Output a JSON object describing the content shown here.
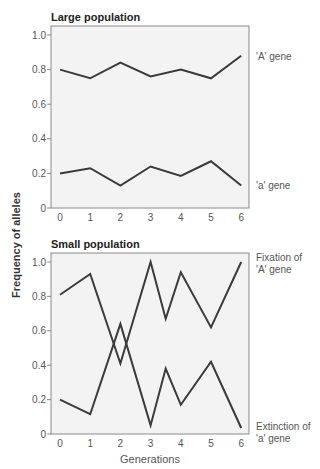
{
  "chart_data": [
    {
      "type": "line",
      "title": "Large population",
      "xlabel": "",
      "ylabel": "Frequency of alleles",
      "ylim": [
        0,
        1.0
      ],
      "yticks": [
        "0",
        "0.2",
        "0.4",
        "0.6",
        "0.8",
        "1.0"
      ],
      "xticks": [
        "0",
        "1",
        "2",
        "3",
        "4",
        "5",
        "6"
      ],
      "x": [
        0,
        1,
        2,
        3,
        4,
        5,
        6
      ],
      "series": [
        {
          "name": "'A' gene",
          "values": [
            0.8,
            0.75,
            0.84,
            0.76,
            0.8,
            0.75,
            0.88
          ]
        },
        {
          "name": "'a' gene",
          "values": [
            0.2,
            0.23,
            0.13,
            0.24,
            0.185,
            0.27,
            0.13
          ]
        }
      ],
      "annotations": [
        "'A' gene",
        "'a' gene"
      ],
      "grid": false
    },
    {
      "type": "line",
      "title": "Small population",
      "xlabel": "Generations",
      "ylabel": "Frequency of alleles",
      "ylim": [
        0,
        1.0
      ],
      "yticks": [
        "0",
        "0.2",
        "0.4",
        "0.6",
        "0.8",
        "1.0"
      ],
      "xticks": [
        "0",
        "1",
        "2",
        "3",
        "4",
        "5",
        "6"
      ],
      "x": [
        0,
        1,
        2,
        3,
        3.5,
        4,
        5,
        6
      ],
      "series": [
        {
          "name": "'A' gene",
          "values": [
            0.81,
            0.93,
            0.41,
            1.0,
            0.67,
            0.94,
            0.62,
            1.0
          ]
        },
        {
          "name": "'a' gene",
          "values": [
            0.2,
            0.115,
            0.64,
            0.05,
            0.38,
            0.17,
            0.42,
            0.035
          ]
        }
      ],
      "annotations": [
        "Fixation of 'A' gene",
        "Extinction of 'a' gene"
      ],
      "grid": false
    }
  ],
  "labels": {
    "top_title": "Large population",
    "bottom_title": "Small population",
    "y_axis": "Frequency of alleles",
    "x_axis": "Generations",
    "top_A": "'A' gene",
    "top_a": "'a' gene",
    "bottom_A_1": "Fixation of",
    "bottom_A_2": "'A' gene",
    "bottom_a_1": "Extinction of",
    "bottom_a_2": "'a' gene"
  },
  "colors": {
    "line": "#3a3a3a",
    "plot_bg": "#f3f3f3",
    "frame": "#8a8a8a"
  }
}
